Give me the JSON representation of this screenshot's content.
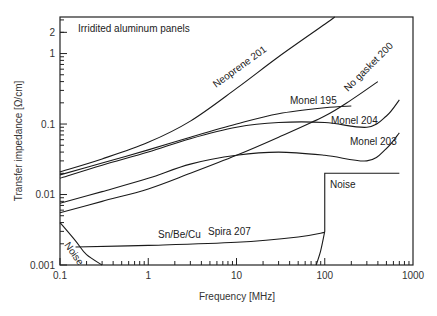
{
  "chart_data": {
    "type": "line",
    "title": "",
    "annotation": "Irridited aluminum panels",
    "xlabel": "Frequency  [MHz]",
    "ylabel": "Transfer impedance  [Ω/cm]",
    "xscale": "log",
    "yscale": "log",
    "xlim": [
      0.1,
      1000
    ],
    "ylim": [
      0.001,
      3.3
    ],
    "xticks": [
      0.1,
      1,
      10,
      100,
      1000
    ],
    "xtick_labels": [
      "0.1",
      "1",
      "10",
      "100",
      "1000"
    ],
    "yticks": [
      0.001,
      0.01,
      0.1,
      1,
      2
    ],
    "ytick_labels": [
      "0.001",
      "0.01",
      "0.1",
      "1",
      "2"
    ],
    "grid": false,
    "legend": "none (inline curve labels)",
    "series": [
      {
        "name": "Neoprene 201",
        "x": [
          0.1,
          0.3,
          1,
          3,
          10,
          30,
          100,
          130
        ],
        "y": [
          0.021,
          0.032,
          0.055,
          0.11,
          0.32,
          0.9,
          2.6,
          3.3
        ]
      },
      {
        "name": "Monel 195",
        "x": [
          0.1,
          0.3,
          1,
          3,
          10,
          30,
          100,
          200
        ],
        "y": [
          0.019,
          0.028,
          0.043,
          0.065,
          0.1,
          0.14,
          0.17,
          0.18
        ]
      },
      {
        "name": "Monel 204",
        "x": [
          0.1,
          0.3,
          1,
          3,
          10,
          30,
          100,
          300,
          500,
          700
        ],
        "y": [
          0.017,
          0.026,
          0.04,
          0.062,
          0.09,
          0.105,
          0.105,
          0.09,
          0.13,
          0.22
        ]
      },
      {
        "name": "No gasket 200",
        "x": [
          0.1,
          0.3,
          1,
          3,
          10,
          30,
          100,
          200,
          400
        ],
        "y": [
          0.0055,
          0.008,
          0.012,
          0.02,
          0.036,
          0.065,
          0.13,
          0.22,
          0.4
        ]
      },
      {
        "name": "Monel 203",
        "x": [
          0.1,
          0.3,
          1,
          3,
          10,
          30,
          100,
          300,
          500,
          700
        ],
        "y": [
          0.0075,
          0.011,
          0.017,
          0.027,
          0.036,
          0.04,
          0.036,
          0.03,
          0.045,
          0.075
        ]
      },
      {
        "name": "Sn/Be/Cu Spira 207",
        "x": [
          0.15,
          1,
          10,
          50,
          100
        ],
        "y": [
          0.0018,
          0.0019,
          0.0021,
          0.0025,
          0.0029
        ]
      },
      {
        "name": "Noise (low frequency)",
        "x": [
          0.1,
          0.15,
          0.2,
          0.3
        ],
        "y": [
          0.004,
          0.0022,
          0.0014,
          0.001
        ]
      },
      {
        "name": "Noise (high frequency)",
        "x": [
          80,
          90,
          100,
          100,
          700
        ],
        "y": [
          0.001,
          0.0016,
          0.003,
          0.02,
          0.02
        ]
      }
    ],
    "curve_labels": [
      {
        "text": "Neoprene 201",
        "series": 0
      },
      {
        "text": "Monel 195",
        "series": 1
      },
      {
        "text": "Monel 204",
        "series": 2
      },
      {
        "text": "No gasket 200",
        "series": 3
      },
      {
        "text": "Monel 203",
        "series": 4
      },
      {
        "text": "Sn/Be/Cu",
        "series": 5
      },
      {
        "text": "Spira 207",
        "series": 5
      },
      {
        "text": "Noise",
        "series": 6
      },
      {
        "text": "Noise",
        "series": 7
      }
    ]
  }
}
